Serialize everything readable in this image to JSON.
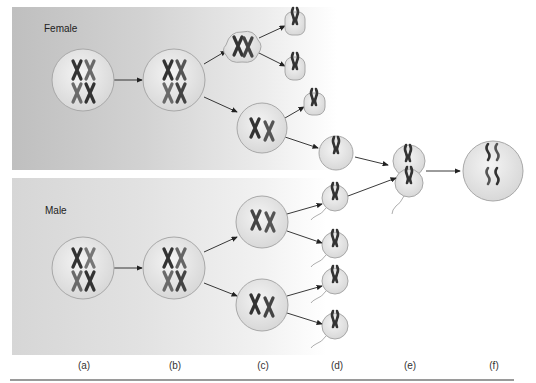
{
  "panels": {
    "female": {
      "label": "Female"
    },
    "male": {
      "label": "Male"
    }
  },
  "stages": [
    {
      "id": "a",
      "label": "(a)"
    },
    {
      "id": "b",
      "label": "(b)"
    },
    {
      "id": "c",
      "label": "(c)"
    },
    {
      "id": "d",
      "label": "(d)"
    },
    {
      "id": "e",
      "label": "(e)"
    },
    {
      "id": "f",
      "label": "(f)"
    }
  ],
  "colors": {
    "cell_fill": "#e6e6e6",
    "cell_stroke": "#a8a8a8",
    "chromosome_dark": "#333333",
    "chromosome_light": "#6a6a6a",
    "arrow": "#222222"
  }
}
